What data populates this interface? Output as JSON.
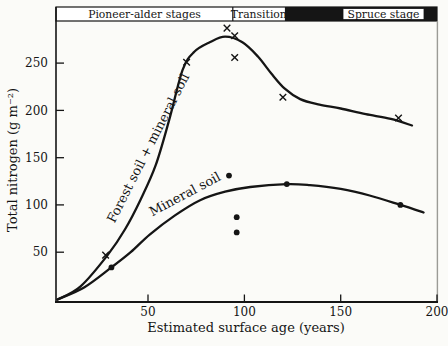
{
  "figure": {
    "colors": {
      "ink": "#151515",
      "paper": "#fbfbf8",
      "frame_right": "#9b9b96"
    }
  },
  "chart_data": {
    "type": "line",
    "title": "",
    "xlabel": "Estimated surface age (years)",
    "ylabel": "Total nitrogen (g m⁻²)",
    "xlim": [
      0,
      200
    ],
    "ylim": [
      0,
      300
    ],
    "x_ticks": [
      50,
      100,
      150,
      200
    ],
    "y_ticks": [
      50,
      100,
      150,
      200,
      250
    ],
    "grid": false,
    "legend_position": "labels drawn along curves",
    "stage_bar": {
      "bands": [
        {
          "label": "Pioneer-alder stages",
          "x_start": 2,
          "x_end": 94,
          "fill": "white"
        },
        {
          "label": "Transition",
          "x_start": 94,
          "x_end": 121,
          "fill": "white"
        },
        {
          "label": "Spruce stage",
          "x_start": 121,
          "x_end": 200,
          "fill": "black"
        }
      ]
    },
    "series": [
      {
        "name": "Forest soil + mineral soil",
        "marker": "x",
        "color": "#151515",
        "points": [
          [
            28,
            47
          ],
          [
            70,
            251
          ],
          [
            91,
            287
          ],
          [
            95,
            279
          ],
          [
            95,
            256
          ],
          [
            120,
            214
          ],
          [
            180,
            192
          ]
        ],
        "curve": [
          [
            3,
            0
          ],
          [
            15,
            14
          ],
          [
            29,
            47
          ],
          [
            38,
            74
          ],
          [
            46,
            105
          ],
          [
            54,
            142
          ],
          [
            61,
            190
          ],
          [
            68,
            243
          ],
          [
            74,
            262
          ],
          [
            82,
            272
          ],
          [
            90,
            278
          ],
          [
            99,
            272
          ],
          [
            107,
            257
          ],
          [
            114,
            239
          ],
          [
            121,
            223
          ],
          [
            129,
            212
          ],
          [
            139,
            206
          ],
          [
            150,
            202
          ],
          [
            163,
            196
          ],
          [
            176,
            191
          ],
          [
            187,
            184
          ]
        ]
      },
      {
        "name": "Mineral soil",
        "marker": "dot",
        "color": "#151515",
        "points": [
          [
            31,
            34
          ],
          [
            92,
            131
          ],
          [
            96,
            87
          ],
          [
            96,
            71
          ],
          [
            122,
            122
          ],
          [
            181,
            100
          ]
        ],
        "curve": [
          [
            3,
            0
          ],
          [
            17,
            13
          ],
          [
            31,
            34
          ],
          [
            41,
            50
          ],
          [
            51,
            69
          ],
          [
            64,
            89
          ],
          [
            77,
            105
          ],
          [
            90,
            114
          ],
          [
            103,
            119
          ],
          [
            122,
            122
          ],
          [
            134,
            121
          ],
          [
            150,
            117
          ],
          [
            165,
            110
          ],
          [
            181,
            100
          ],
          [
            193,
            92
          ]
        ]
      }
    ]
  }
}
